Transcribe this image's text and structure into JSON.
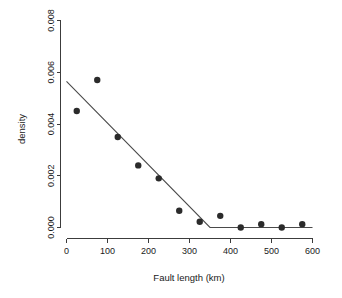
{
  "chart_data": {
    "type": "scatter",
    "title": "",
    "xlabel": "Fault length (km)",
    "ylabel": "density",
    "xlim": [
      0,
      600
    ],
    "ylim": [
      0.0,
      0.008
    ],
    "grid": false,
    "legend": "none",
    "xticks": [
      "0",
      "100",
      "200",
      "300",
      "400",
      "500",
      "600"
    ],
    "xtick_values": [
      0,
      100,
      200,
      300,
      400,
      500,
      600
    ],
    "yticks": [
      "0.000",
      "0.002",
      "0.004",
      "0.006",
      "0.008"
    ],
    "ytick_values": [
      0.0,
      0.002,
      0.004,
      0.006,
      0.008
    ],
    "points": [
      {
        "x": 25,
        "y": 0.0045
      },
      {
        "x": 75,
        "y": 0.0057
      },
      {
        "x": 125,
        "y": 0.0035
      },
      {
        "x": 175,
        "y": 0.0024
      },
      {
        "x": 225,
        "y": 0.0019
      },
      {
        "x": 275,
        "y": 0.00065
      },
      {
        "x": 325,
        "y": 0.00022
      },
      {
        "x": 375,
        "y": 0.00045
      },
      {
        "x": 425,
        "y": 0.0
      },
      {
        "x": 475,
        "y": 0.00013
      },
      {
        "x": 525,
        "y": 0.0
      },
      {
        "x": 575,
        "y": 0.00013
      }
    ],
    "series": [
      {
        "name": "segmented-fit",
        "type": "line",
        "points": [
          {
            "x": 0,
            "y": 0.00565
          },
          {
            "x": 350,
            "y": 0.0
          },
          {
            "x": 600,
            "y": 0.0
          }
        ],
        "breakpoint_x": 350
      }
    ],
    "marker": {
      "shape": "circle",
      "size_px": 3.2,
      "color": "#2b2b2b"
    },
    "line_color": "#4a4a4a",
    "axis_color": "#3c3c3c"
  }
}
